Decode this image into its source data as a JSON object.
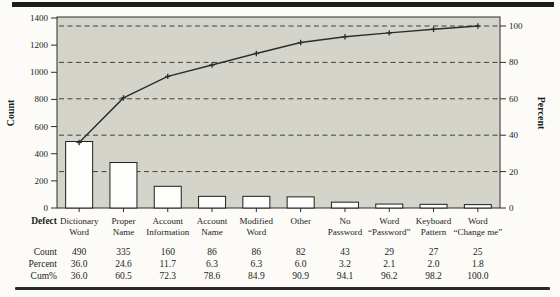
{
  "chart_data": {
    "type": "bar",
    "subtype": "pareto",
    "title": "",
    "categories": [
      "Dictionary Word",
      "Proper Name",
      "Account Information",
      "Account Name",
      "Modified Word",
      "Other",
      "No Password",
      "Word “Password”",
      "Keyboard Pattern",
      "Word “Change me”"
    ],
    "category_lines": [
      [
        "Dictionary",
        "Word"
      ],
      [
        "Proper",
        "Name"
      ],
      [
        "Account",
        "Information"
      ],
      [
        "Account",
        "Name"
      ],
      [
        "Modified",
        "Word"
      ],
      [
        "Other"
      ],
      [
        "No",
        "Password"
      ],
      [
        "Word",
        "“Password”"
      ],
      [
        "Keyboard",
        "Pattern"
      ],
      [
        "Word",
        "“Change me”"
      ]
    ],
    "counts": [
      490,
      335,
      160,
      86,
      86,
      82,
      43,
      29,
      27,
      25
    ],
    "percents": [
      "36.0",
      "24.6",
      "11.7",
      "6.3",
      "6.3",
      "6.0",
      "3.2",
      "2.1",
      "2.0",
      "1.8"
    ],
    "cum_percents": [
      "36.0",
      "60.5",
      "72.3",
      "78.6",
      "84.9",
      "90.9",
      "94.1",
      "96.2",
      "98.2",
      "100.0"
    ],
    "left_axis": {
      "label": "Count",
      "ticks": [
        "0",
        "200",
        "400",
        "600",
        "800",
        "1000",
        "1200",
        "1400"
      ],
      "min": 0,
      "max": 1400
    },
    "right_axis": {
      "label": "Percent",
      "ticks": [
        "0",
        "20",
        "40",
        "60",
        "80",
        "100"
      ],
      "min": 0,
      "max": 100
    },
    "grid": "dashed horizontal lines at 20/40/60/80/100 percent",
    "legend": "none",
    "colors": {
      "plot_background": "#d4d4cb",
      "bar_fill": "#fdfdfc",
      "bar_border": "#1f1f1f",
      "line": "#2d2d2d",
      "grid_line": "#3f3f3f",
      "axis": "#2d2d2d",
      "text": "#1b1b1b",
      "rule": "#1c1c1c"
    }
  },
  "table": {
    "rows": [
      {
        "key": "defect",
        "label": "Defect"
      },
      {
        "key": "count",
        "label": "Count",
        "values": [
          "490",
          "335",
          "160",
          "86",
          "86",
          "82",
          "43",
          "29",
          "27",
          "25"
        ]
      },
      {
        "key": "percent",
        "label": "Percent",
        "values": [
          "36.0",
          "24.6",
          "11.7",
          "6.3",
          "6.3",
          "6.0",
          "3.2",
          "2.1",
          "2.0",
          "1.8"
        ]
      },
      {
        "key": "cum",
        "label": "Cum%",
        "values": [
          "36.0",
          "60.5",
          "72.3",
          "78.6",
          "84.9",
          "90.9",
          "94.1",
          "96.2",
          "98.2",
          "100.0"
        ]
      }
    ]
  }
}
